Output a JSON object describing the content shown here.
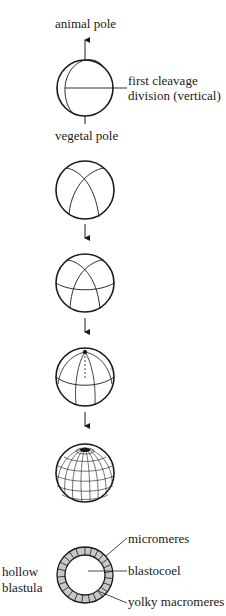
{
  "labels": {
    "animal_pole": "animal pole",
    "first_cleavage_line1": "first cleavage",
    "first_cleavage_line2": "division (vertical)",
    "vegetal_pole": "vegetal pole",
    "hollow": "hollow",
    "blastula": "blastula",
    "micromeres": "micromeres",
    "blastocoel": "blastocoel",
    "yolky_macromeres": "yolky macromeres"
  },
  "stages": [
    {
      "id": "zygote-first-cleavage",
      "cells": 2
    },
    {
      "id": "second-cleavage",
      "cells": 4
    },
    {
      "id": "third-cleavage",
      "cells": 8
    },
    {
      "id": "fourth-cleavage",
      "cells": 16
    },
    {
      "id": "morula",
      "cells": "many"
    },
    {
      "id": "hollow-blastula",
      "cells": "many"
    }
  ],
  "colors": {
    "line": "#1a1a1a",
    "cell_fill": "#c8c8c8",
    "background": "#ffffff"
  }
}
